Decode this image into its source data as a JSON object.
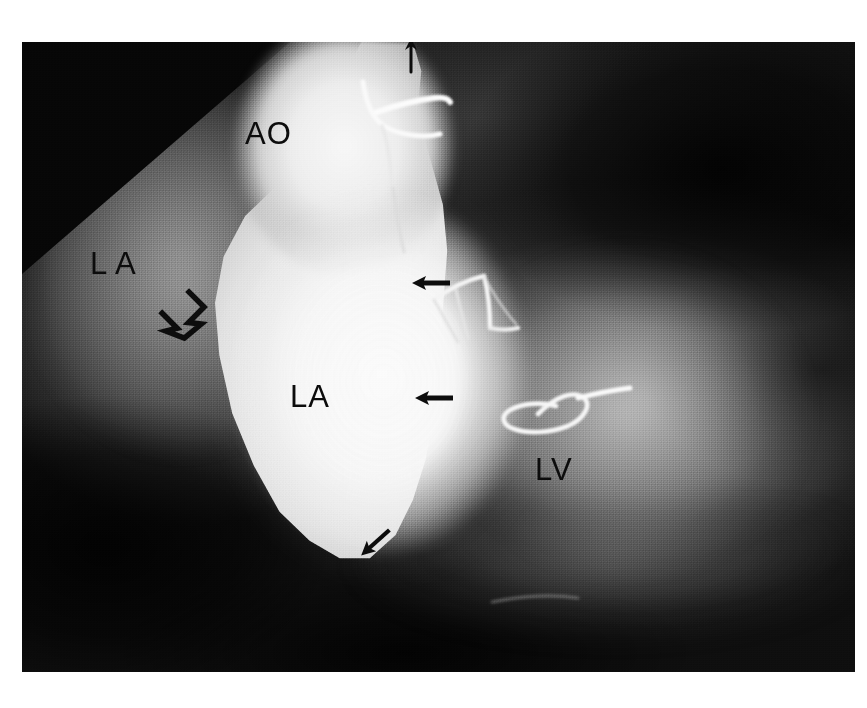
{
  "image": {
    "modality": "radiograph",
    "study_type": "cardiac angiogram",
    "width": 867,
    "height": 708,
    "background_color": "#ffffff",
    "plate_color": "#1b1b1b",
    "contrast_color": "#f8f8f8",
    "annotation_color": "#0c0c0c"
  },
  "annotations": {
    "labels": [
      {
        "id": "ao",
        "text": "AO",
        "x": 245,
        "y": 92,
        "size": 31,
        "spacing": 1
      },
      {
        "id": "la-upper",
        "text": "L A",
        "x": 90,
        "y": 222,
        "size": 31,
        "spacing": 1
      },
      {
        "id": "la-center",
        "text": "LA",
        "x": 290,
        "y": 355,
        "size": 31,
        "spacing": 1
      },
      {
        "id": "lv",
        "text": "LV",
        "x": 535,
        "y": 428,
        "size": 31,
        "spacing": 1
      }
    ],
    "arrows": [
      {
        "id": "arrow-top-aortic",
        "style": "solid",
        "direction": "up",
        "x": 386,
        "y": 36,
        "length": 30,
        "thickness": 3
      },
      {
        "id": "arrow-open-la-border",
        "style": "open",
        "direction": "down-right",
        "x": 150,
        "y": 275,
        "size": 52
      },
      {
        "id": "arrow-mid-upper",
        "style": "solid",
        "direction": "left",
        "x": 415,
        "y": 282,
        "length": 33,
        "thickness": 5
      },
      {
        "id": "arrow-mid-lower",
        "style": "solid",
        "direction": "left",
        "x": 418,
        "y": 397,
        "length": 33,
        "thickness": 5
      },
      {
        "id": "arrow-inferior",
        "style": "solid",
        "direction": "up-left",
        "x": 363,
        "y": 535,
        "length": 30,
        "thickness": 4
      }
    ],
    "catheters": [
      {
        "id": "catheter-aortic-hook",
        "description": "hooked radio-opaque catheter tip at aortic root",
        "x": 360,
        "y": 60
      },
      {
        "id": "catheter-mid-branch",
        "description": "branching radio-opaque wire mid-field",
        "x": 420,
        "y": 238
      },
      {
        "id": "catheter-loop",
        "description": "looped radio-opaque catheter tip",
        "x": 450,
        "y": 372
      }
    ]
  },
  "legend": {
    "ao": "Aorta",
    "la": "Left atrium",
    "lv": "Left ventricle"
  }
}
